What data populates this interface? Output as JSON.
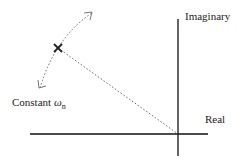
{
  "diagram": {
    "axes": {
      "imaginary_label": "Imaginary",
      "real_label": "Real"
    },
    "annotation": {
      "prefix": "Constant ",
      "symbol": "ω",
      "subscript": "n"
    },
    "pole_marker": "×",
    "colors": {
      "axis": "#111111",
      "dotted": "#666666",
      "text": "#222222"
    }
  }
}
